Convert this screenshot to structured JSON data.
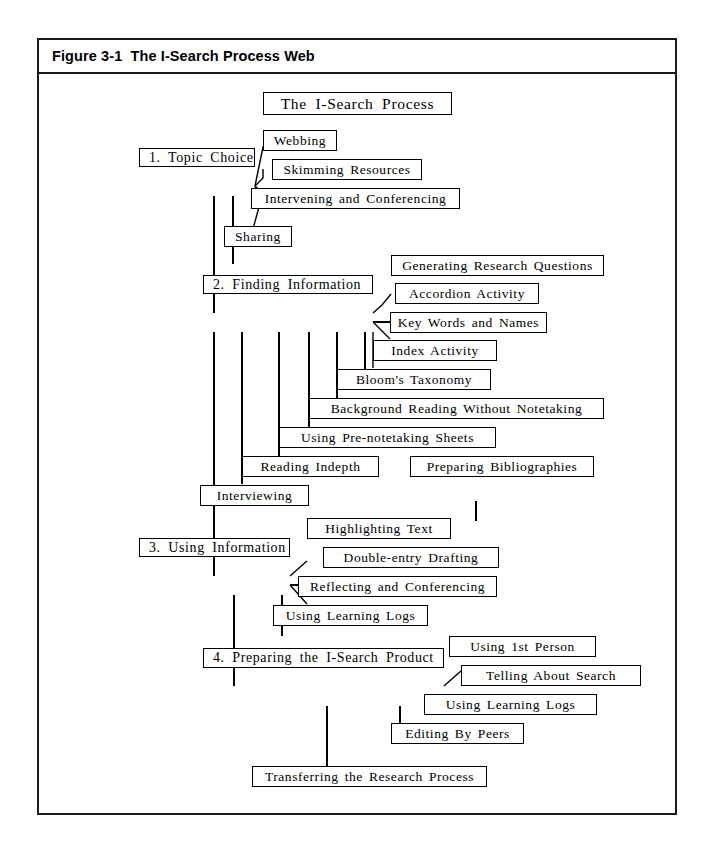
{
  "figure": {
    "title": "Figure 3-1  The I-Search Process Web"
  },
  "diagram": {
    "kind": "process-web",
    "root_label": "The I-Search Process",
    "stages": [
      {
        "id": "stage-1",
        "label": "1.   Topic Choice",
        "children": [
          "Webbing",
          "Skimming  Resources",
          "Intervening  and  Conferencing",
          "Sharing"
        ]
      },
      {
        "id": "stage-2",
        "label": "2.    Finding  Information",
        "children": [
          "Generating  Research  Questions",
          "Accordion   Activity",
          "Key  Words  and  Names",
          "Index   Activity",
          "Bloom's  Taxonomy",
          "Background  Reading  Without  Notetaking",
          "Using  Pre-notetaking  Sheets",
          "Reading   Indepth",
          "Preparing   Bibliographies",
          "Interviewing"
        ]
      },
      {
        "id": "stage-3",
        "label": "3.    Using  Information",
        "children": [
          "Highlighting  Text",
          "Double-entry  Drafting",
          "Reflecting  and  Conferencing",
          "Using Learning Logs"
        ]
      },
      {
        "id": "stage-4",
        "label": "4.      Preparing  the  I-Search  Product",
        "children": [
          "Using  1st  Person",
          "Telling  About  Search",
          "Using  Learning  Logs",
          "Editing  By  Peers",
          "Transferring  the  Research  Process"
        ]
      }
    ],
    "nodes": {
      "root": "The I-Search Process",
      "stage1": "1.   Topic Choice",
      "webbing": "Webbing",
      "skimming": "Skimming  Resources",
      "intervening": "Intervening  and  Conferencing",
      "sharing": "Sharing",
      "stage2": "2.    Finding  Information",
      "generating": "Generating  Research  Questions",
      "accordion": "Accordion   Activity",
      "keywords": "Key  Words  and  Names",
      "indexact": "Index   Activity",
      "blooms": "Bloom's  Taxonomy",
      "background": "Background  Reading  Without  Notetaking",
      "prenote": "Using  Pre-notetaking  Sheets",
      "readingindepth": "Reading   Indepth",
      "preparingbib": "Preparing   Bibliographies",
      "interviewing": "Interviewing",
      "stage3": "3.    Using  Information",
      "highlighting": "Highlighting  Text",
      "doubleentry": "Double-entry  Drafting",
      "reflecting": "Reflecting  and  Conferencing",
      "logs3": "Using Learning Logs",
      "stage4": "4.      Preparing  the  I-Search  Product",
      "firstperson": "Using  1st  Person",
      "telling": "Telling  About  Search",
      "logs4": "Using  Learning  Logs",
      "editing": "Editing  By  Peers",
      "transferring": "Transferring  the  Research  Process"
    }
  },
  "colors": {
    "line": "#000000",
    "frame": "#1a1a1a",
    "background": "#ffffff"
  }
}
